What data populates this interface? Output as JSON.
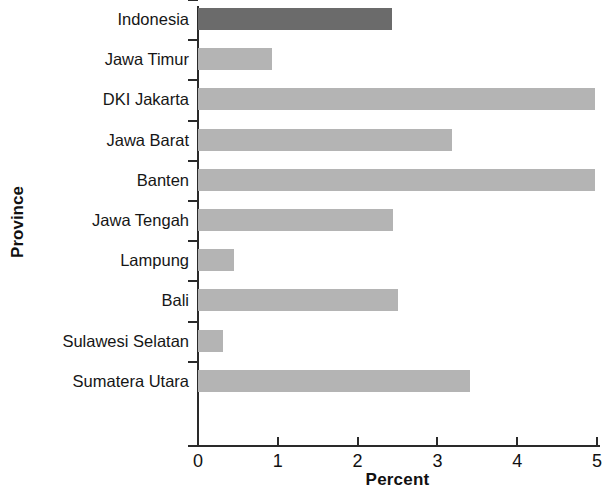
{
  "chart_data": {
    "type": "bar",
    "orientation": "horizontal",
    "title": "",
    "xlabel": "Percent",
    "ylabel": "Province",
    "xlim": [
      0,
      5
    ],
    "xticks": [
      "0",
      "1",
      "2",
      "3",
      "4",
      "5"
    ],
    "grid": false,
    "legend": null,
    "highlight_category": "Indonesia",
    "colors": {
      "bar": "#b4b4b4",
      "highlight_bar": "#6b6b6b",
      "axis": "#2a2a2a",
      "text": "#161616",
      "background": "#ffffff"
    },
    "categories": [
      "Indonesia",
      "Jawa Timur",
      "DKI Jakarta",
      "Jawa Barat",
      "Banten",
      "Jawa Tengah",
      "Lampung",
      "Bali",
      "Sulawesi Selatan",
      "Sumatera Utara"
    ],
    "values": [
      2.43,
      0.93,
      4.98,
      3.18,
      4.97,
      2.44,
      0.45,
      2.51,
      0.31,
      3.41
    ]
  }
}
